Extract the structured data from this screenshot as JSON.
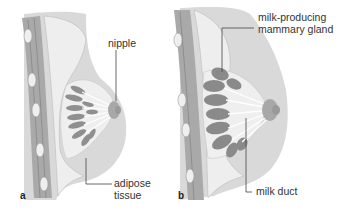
{
  "figure": {
    "panels": [
      {
        "letter": "a",
        "labels": {
          "nipple": "nipple",
          "adipose_line1": "adipose",
          "adipose_line2": "tissue"
        }
      },
      {
        "letter": "b",
        "labels": {
          "gland_line1": "milk-producing",
          "gland_line2": "mammary gland",
          "duct": "milk duct"
        }
      }
    ],
    "colors": {
      "skin": "#d6d6d6",
      "skin_dark": "#b8b8b8",
      "fat": "#ececec",
      "muscle": "#a8a8a8",
      "lobule": "#8a8a8a",
      "leader": "#444444",
      "text": "#333333"
    }
  }
}
